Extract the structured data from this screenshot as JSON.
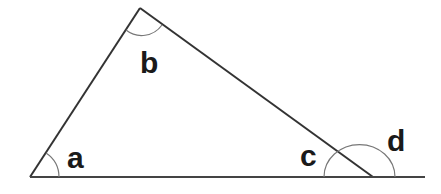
{
  "diagram": {
    "type": "triangle-angles",
    "vertices": {
      "A": [
        30,
        177
      ],
      "B": [
        140,
        8
      ],
      "C": [
        373,
        177
      ]
    },
    "baseline_end": [
      425,
      177
    ],
    "labels": {
      "a": "a",
      "b": "b",
      "c": "c",
      "d": "d"
    },
    "colors": {
      "line": "#333333",
      "arc": "#666666",
      "text": "#1a1a1a",
      "background": "#ffffff"
    }
  }
}
